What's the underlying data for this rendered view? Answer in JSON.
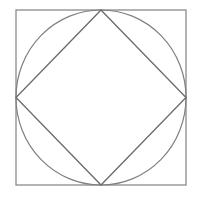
{
  "figure": {
    "canvas": {
      "width": 198,
      "height": 198,
      "background": "#ffffff"
    },
    "outer_square": {
      "x": 16,
      "y": 10,
      "width": 170,
      "height": 175,
      "stroke": "#808080",
      "stroke_width": 1.2
    },
    "circle": {
      "cx": 101,
      "cy": 97.5,
      "rx": 85,
      "ry": 87.5,
      "stroke": "#808080",
      "stroke_width": 1.2
    },
    "diamond": {
      "points": [
        [
          101,
          10
        ],
        [
          186,
          97.5
        ],
        [
          101,
          185
        ],
        [
          16,
          97.5
        ]
      ],
      "stroke": "#6a6a6a",
      "stroke_width": 1.3
    }
  }
}
